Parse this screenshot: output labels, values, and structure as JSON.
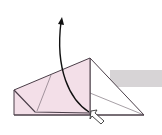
{
  "diagram": {
    "type": "origami-fold-step",
    "colors": {
      "paper_pink": "#f3dfe8",
      "paper_white": "#ffffff",
      "outline": "#4a3e48",
      "arrow": "#111111",
      "band": "#d7d4d6"
    },
    "elements": [
      "pink-folded-layer",
      "white-triangle-flap",
      "curved-fold-arrow",
      "hollow-push-arrow",
      "gray-band"
    ]
  }
}
